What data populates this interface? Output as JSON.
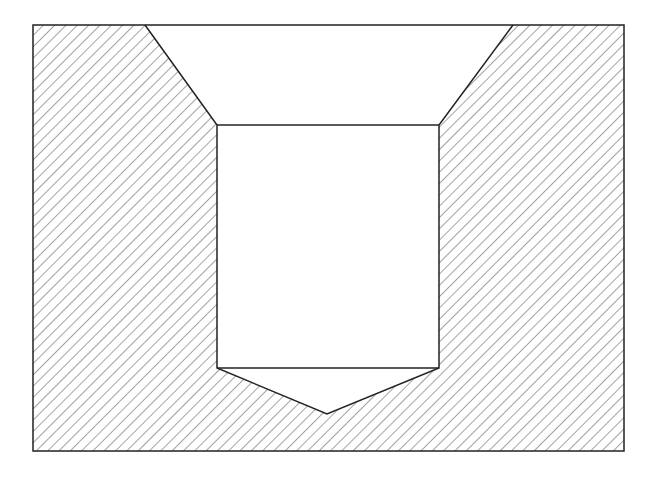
{
  "diagram": {
    "type": "section-view",
    "colors": {
      "background": "#ffffff",
      "stroke": "#222222",
      "hatch": "#555555"
    },
    "outer": {
      "x1": 33,
      "y1": 25,
      "x2": 624,
      "y2": 451
    },
    "countersink_top": {
      "left_x": 145,
      "right_x": 513,
      "y": 25
    },
    "bore": {
      "left_x": 217,
      "right_x": 439,
      "top_y": 125,
      "bottom_y": 368
    },
    "drill_tip": {
      "x": 327,
      "y": 414
    },
    "hatch_spacing": 8,
    "hatch_direction": "top-left to bottom-right"
  }
}
